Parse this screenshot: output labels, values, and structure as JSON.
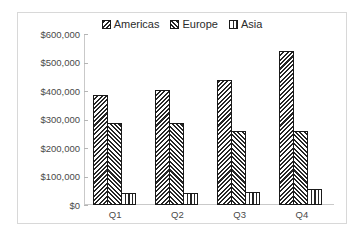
{
  "chart_data": {
    "type": "bar",
    "title": "",
    "subtitle": "",
    "xlabel": "",
    "ylabel": "",
    "categories": [
      "Q1",
      "Q2",
      "Q3",
      "Q4"
    ],
    "series": [
      {
        "name": "Americas",
        "pattern": "diagonal-hatch-down",
        "values": [
          387000,
          405000,
          440000,
          540000
        ]
      },
      {
        "name": "Europe",
        "pattern": "diagonal-hatch-up",
        "values": [
          287000,
          287000,
          260000,
          260000
        ]
      },
      {
        "name": "Asia",
        "pattern": "vertical-lines",
        "values": [
          42000,
          42000,
          45000,
          55000
        ]
      }
    ],
    "ylim": [
      0,
      600000
    ],
    "ytick_values": [
      0,
      100000,
      200000,
      300000,
      400000,
      500000,
      600000
    ],
    "ytick_labels": [
      "$0",
      "$100,000",
      "$200,000",
      "$300,000",
      "$400,000",
      "$500,000",
      "$600,000"
    ],
    "grid": false,
    "legend_position": "top-center",
    "legend_entries": [
      "Americas",
      "Europe",
      "Asia"
    ],
    "annotations": [],
    "colors": {
      "bar_outline": "#1a1a1a",
      "hatch": "#262626",
      "bar_fill": "#ffffff",
      "axis_line": "#c9c9c9",
      "tick_label": "#4a4a4a",
      "legend_label": "#2b2b2b",
      "plot_background": "#ffffff",
      "frame_border": "#d8d8d8"
    }
  }
}
